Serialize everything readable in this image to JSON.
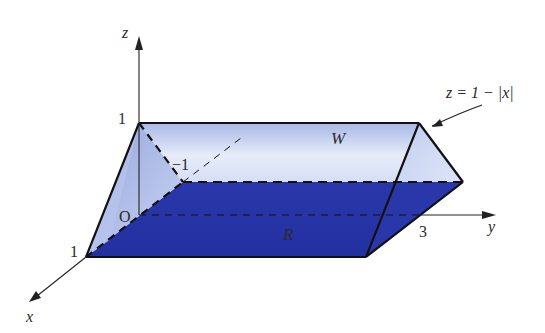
{
  "figure": {
    "type": "3d-solid-wedge",
    "axes": {
      "x_label": "x",
      "y_label": "y",
      "z_label": "z",
      "origin_label": "O"
    },
    "tick_labels": {
      "z_one": "1",
      "x_one": "1",
      "x_neg_one": "−1",
      "y_three": "3"
    },
    "region_labels": {
      "solid": "W",
      "base": "R"
    },
    "surface_equation": "z = 1 − |x|",
    "colors": {
      "base_fill": "#2b36a8",
      "face_light": "#c9d4f0",
      "face_mid": "#8fa3de",
      "end_face": "#dfe6f7",
      "edge": "#111111"
    }
  }
}
